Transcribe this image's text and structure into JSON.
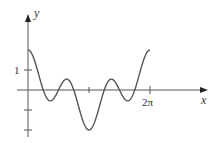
{
  "chart_data": {
    "type": "line",
    "title": "",
    "xlabel": "x",
    "ylabel": "y",
    "function_shape": "y = cos x + cos 3x (approx.)",
    "x": [
      0,
      0.3927,
      0.7854,
      1.1781,
      1.5708,
      1.9635,
      2.3562,
      2.7489,
      3.1416,
      3.5343,
      3.927,
      4.3197,
      4.7124,
      5.1051,
      5.4978,
      5.8905,
      6.2832
    ],
    "values": [
      2.0,
      1.306,
      0.0,
      -0.765,
      0.0,
      0.765,
      0.0,
      -1.306,
      -2.0,
      -1.306,
      0.0,
      0.765,
      0.0,
      -0.765,
      0.0,
      1.306,
      2.0
    ],
    "xlim": [
      0,
      6.2832
    ],
    "ylim": [
      -2,
      2
    ],
    "x_ticks": [
      {
        "value": 3.1416,
        "label": ""
      },
      {
        "value": 6.2832,
        "label": "2π"
      }
    ],
    "y_ticks": [
      {
        "value": 1,
        "label": "1"
      },
      {
        "value": 2,
        "label": ""
      },
      {
        "value": -1,
        "label": ""
      },
      {
        "value": -2,
        "label": ""
      }
    ],
    "grid": false,
    "legend": "none"
  },
  "labels": {
    "x_axis": "x",
    "y_axis": "y",
    "y_tick_1": "1",
    "x_tick_2pi": "2π"
  }
}
